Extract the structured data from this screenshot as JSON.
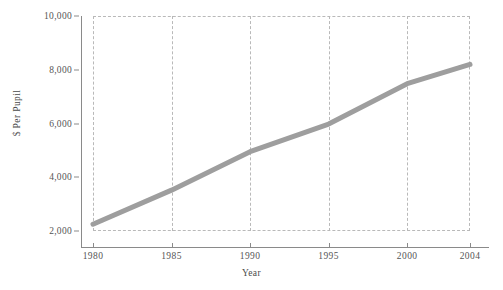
{
  "chart_data": {
    "type": "line",
    "title": "",
    "xlabel": "Year",
    "ylabel": "$ Per Pupil",
    "x": [
      1980,
      1985,
      1990,
      1995,
      2000,
      2004
    ],
    "values": [
      2250,
      3520,
      4950,
      5980,
      7480,
      8200
    ],
    "series": [
      {
        "name": "$ Per Pupil",
        "values": [
          2250,
          3520,
          4950,
          5980,
          7480,
          8200
        ],
        "color": "#9e9e9e"
      }
    ],
    "xlim": [
      1980,
      2004
    ],
    "ylim": [
      2000,
      10000
    ],
    "xticks": [
      1980,
      1985,
      1990,
      1995,
      2000,
      2004
    ],
    "xtick_labels": [
      "1980",
      "1985",
      "1990",
      "1995",
      "2000",
      "2004"
    ],
    "yticks": [
      2000,
      4000,
      6000,
      8000,
      10000
    ],
    "ytick_labels": [
      "2,000",
      "4,000",
      "6,000",
      "8,000",
      "10,000"
    ],
    "grid": "vertical-dashed",
    "legend": "none",
    "line_width": 5,
    "colors": {
      "line": "#9e9e9e",
      "grid": "#b9b9b9",
      "axis": "#8a8a8a",
      "text": "#555555",
      "background": "#ffffff"
    }
  },
  "axes": {
    "y_title": "$ Per Pupil",
    "x_title": "Year"
  }
}
